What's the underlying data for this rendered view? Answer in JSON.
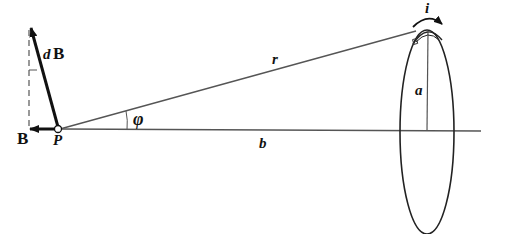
{
  "figure": {
    "labels": {
      "dB_d": "d",
      "dB_B": "B",
      "B": "B",
      "P": "P",
      "r": "r",
      "phi": "φ",
      "b": "b",
      "a": "a",
      "i": "i"
    },
    "colors": {
      "stroke": "#222222",
      "thin_line": "#555555",
      "background": "#ffffff"
    }
  }
}
